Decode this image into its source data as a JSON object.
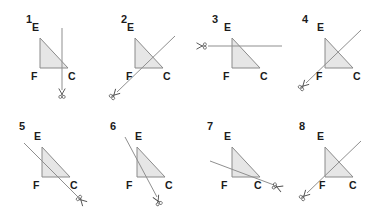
{
  "figure": {
    "title": "",
    "background_color": "#ffffff",
    "triangle_fill": "#e6e6e6",
    "triangle_stroke": "#8a8a8a",
    "line_color": "#8f8f8f",
    "label_color": "#1b1b1b",
    "scissors_color": "#4a4a4a",
    "vertex_labels": [
      "E",
      "F",
      "C"
    ],
    "panel_count": 8,
    "rows": 2,
    "columns": 4
  },
  "panels": [
    {
      "number": "1",
      "label_E": "E",
      "label_F": "F",
      "label_C": "C",
      "cut_orientation": "vertical",
      "cut_description": "vertical line through vertex C region, scissors below",
      "scissors_position": "bottom"
    },
    {
      "number": "2",
      "label_E": "E",
      "label_F": "F",
      "label_C": "C",
      "cut_orientation": "diagonal-up-right",
      "cut_description": "diagonal line from lower-left to upper-right crossing triangle, scissors lower-left",
      "scissors_position": "bottom-left"
    },
    {
      "number": "3",
      "label_E": "E",
      "label_F": "F",
      "label_C": "C",
      "cut_orientation": "horizontal",
      "cut_description": "horizontal line crossing triangle below vertex E, scissors at left",
      "scissors_position": "left"
    },
    {
      "number": "4",
      "label_E": "E",
      "label_F": "F",
      "label_C": "C",
      "cut_orientation": "diagonal-up-right",
      "cut_description": "diagonal line from lower-left near F to upper-right, scissors lower-left",
      "scissors_position": "bottom-left"
    },
    {
      "number": "5",
      "label_E": "E",
      "label_F": "F",
      "label_C": "C",
      "cut_orientation": "diagonal-down-right",
      "cut_description": "diagonal line parallel to hypotenuse from upper-left to lower-right, scissors lower-right",
      "scissors_position": "bottom-right"
    },
    {
      "number": "6",
      "label_E": "E",
      "label_F": "F",
      "label_C": "C",
      "cut_orientation": "steep-diagonal",
      "cut_description": "steep line from upper-left through vertex E down to lower-right, scissors below",
      "scissors_position": "bottom"
    },
    {
      "number": "7",
      "label_E": "E",
      "label_F": "F",
      "label_C": "C",
      "cut_orientation": "shallow-diagonal-down-right",
      "cut_description": "shallow line from left crossing triangle exiting at vertex C, scissors right",
      "scissors_position": "right"
    },
    {
      "number": "8",
      "label_E": "E",
      "label_F": "F",
      "label_C": "C",
      "cut_orientation": "diagonal-down-left",
      "cut_description": "diagonal line from upper-right down to vertex F, scissors lower-left",
      "scissors_position": "bottom-left"
    }
  ]
}
